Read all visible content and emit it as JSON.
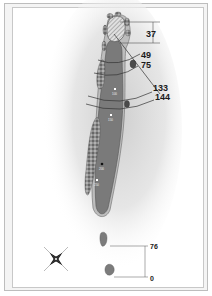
{
  "diagram": {
    "type": "golf-hole-layout",
    "green_depth_label": "37",
    "distance_labels": [
      {
        "id": "d49",
        "value": "49"
      },
      {
        "id": "d75",
        "value": "75"
      },
      {
        "id": "d133",
        "value": "133"
      },
      {
        "id": "d144",
        "value": "144"
      }
    ],
    "tee_labels": [
      {
        "id": "t76",
        "value": "76"
      },
      {
        "id": "t0",
        "value": "0"
      }
    ],
    "yardage_markers": [
      {
        "id": "m1",
        "value": "100"
      },
      {
        "id": "m2",
        "value": "150"
      },
      {
        "id": "m3",
        "value": "200"
      },
      {
        "id": "m4",
        "value": "250"
      }
    ],
    "compass": "compass-rose",
    "colors": {
      "fairway": "#7a7a7a",
      "green": "#d8d8d8",
      "rough_edge": "#9a9a9a",
      "bunker": "#b0b0b0",
      "tee": "#7c7c7c",
      "line": "#444444",
      "frame": "#bdbdbd"
    }
  }
}
